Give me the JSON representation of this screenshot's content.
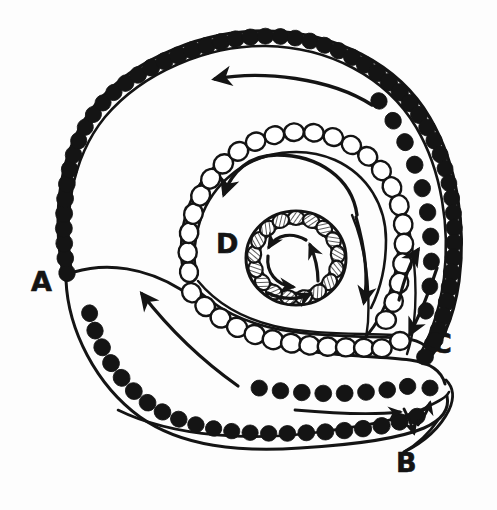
{
  "figure": {
    "background_color": "#fdfdfd",
    "ink_color": "#141414",
    "width": 497,
    "height": 510
  },
  "labels": [
    {
      "id": "A",
      "text": "A",
      "x": 35,
      "y": 282,
      "role": "outer-left-opening-label"
    },
    {
      "id": "B",
      "text": "B",
      "x": 405,
      "y": 464,
      "role": "lower-right-duct-label"
    },
    {
      "id": "C",
      "text": "C",
      "x": 440,
      "y": 344,
      "role": "right-channel-label"
    },
    {
      "id": "D",
      "text": "D",
      "x": 228,
      "y": 244,
      "role": "middle-spiral-label"
    }
  ],
  "structures": {
    "outer_spiral": {
      "name": "outer-turn",
      "cell_style": "filled",
      "cell_color": "#141414",
      "cell_count": 54,
      "description": "Large outer coil lined with solid black round cells on a single line, doubling to two rows along the right flank"
    },
    "middle_spiral": {
      "name": "middle-turn",
      "cell_style": "open",
      "cell_color": "#ffffff",
      "cell_outline": "#141414",
      "cell_count": 34,
      "description": "Inner coil lined with open white oval cells outlined in black"
    },
    "inner_spiral": {
      "name": "inner-turn",
      "cell_style": "hatched",
      "cell_color": "#ffffff",
      "cell_outline": "#141414",
      "cell_count": 17,
      "description": "Innermost ring of small cells each filled with fine internal hatch marks"
    },
    "lower_tail": {
      "name": "lower-duct",
      "cell_style": "filled",
      "cell_count": 22,
      "description": "Descending tail duct lined with solid black cells leading to point B"
    }
  },
  "arrows": [
    {
      "id": "arrow-outer-top",
      "direction": "right-to-left",
      "region": "outer-turn-top",
      "meaning": "flow along outer turn toward A"
    },
    {
      "id": "arrow-middle-top",
      "direction": "clockwise-to-down-left",
      "region": "middle-turn-top",
      "meaning": "flow along middle turn toward D"
    },
    {
      "id": "arrow-inner-spiral-1",
      "direction": "counterclockwise",
      "region": "inner-ring",
      "meaning": "inward spiral flow"
    },
    {
      "id": "arrow-inner-spiral-2",
      "direction": "counterclockwise",
      "region": "inner-ring",
      "meaning": "inward spiral flow"
    },
    {
      "id": "arrow-inner-spiral-3",
      "direction": "counterclockwise",
      "region": "inner-ring",
      "meaning": "inward spiral flow"
    },
    {
      "id": "arrow-inner-up",
      "direction": "upward",
      "region": "inner-ring-right",
      "meaning": "return flow"
    },
    {
      "id": "arrow-right-down",
      "direction": "downward",
      "region": "right-channel-inner",
      "meaning": "descending flow near C"
    },
    {
      "id": "arrow-right-up",
      "direction": "upward",
      "region": "right-channel-outer",
      "meaning": "ascending flow near C"
    },
    {
      "id": "arrow-right-down-outer",
      "direction": "downward",
      "region": "right-channel-far",
      "meaning": "descending flow to C"
    },
    {
      "id": "arrow-tail-up-left",
      "direction": "up-left",
      "region": "lower-duct",
      "meaning": "flow up the lower duct toward A"
    },
    {
      "id": "arrow-b-right",
      "direction": "right",
      "region": "duct-b",
      "meaning": "flow out at B"
    },
    {
      "id": "arrow-b-down",
      "direction": "down-right",
      "region": "duct-b",
      "meaning": "flow out at B"
    },
    {
      "id": "arrow-b-up",
      "direction": "up-right",
      "region": "duct-b",
      "meaning": "flow in at B"
    }
  ]
}
